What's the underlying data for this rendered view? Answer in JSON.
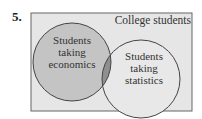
{
  "problem_number": "5.",
  "universe_label": "College students",
  "sets": [
    {
      "label_lines": [
        "Students",
        "taking",
        "economics"
      ],
      "fill": "#c4c4c4"
    },
    {
      "label_lines": [
        "Students",
        "taking",
        "statistics"
      ],
      "fill": "#e8e8e8"
    }
  ],
  "colors": {
    "frame_bg": "#e6e6e6",
    "intersection": "#8f8f8f",
    "stroke": "#444444"
  }
}
